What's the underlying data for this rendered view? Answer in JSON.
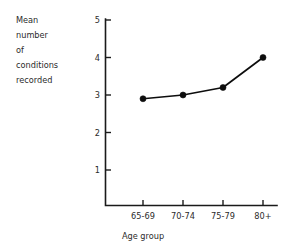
{
  "chart_data": {
    "type": "line",
    "title": "",
    "subtitle": "",
    "xlabel": "Age group",
    "ylabel": "Mean number of conditions recorded",
    "ylabel_lines": [
      "Mean",
      "number",
      "of",
      "conditions",
      "recorded"
    ],
    "categories": [
      "65-69",
      "70-74",
      "75-79",
      "80+"
    ],
    "values": [
      2.9,
      3.0,
      3.2,
      4.0
    ],
    "series": [
      {
        "name": "Mean number of conditions recorded",
        "values": [
          2.9,
          3.0,
          3.2,
          4.0
        ]
      }
    ],
    "ylim": [
      0,
      5
    ],
    "yticks": [
      1,
      2,
      3,
      4,
      5
    ],
    "ytick_labels": [
      "1",
      "2",
      "3",
      "4",
      "5"
    ],
    "xtick_labels": [
      "65-69",
      "70-74",
      "75-79",
      "80+"
    ],
    "grid": false,
    "legend": false,
    "legend_position": "none",
    "marker": "filled-circle",
    "line_color": "#0d0d0d",
    "marker_color": "#0d0d0d",
    "axis_color": "#1a1a1a",
    "background_color": "#ffffff"
  },
  "axis_labels": {
    "y_line_1": "Mean",
    "y_line_2": "number",
    "y_line_3": "of",
    "y_line_4": "conditions",
    "y_line_5": "recorded",
    "x_title": "Age group"
  },
  "y_ticks": {
    "t1": "1",
    "t2": "2",
    "t3": "3",
    "t4": "4",
    "t5": "5"
  },
  "x_ticks": {
    "c1": "65-69",
    "c2": "70-74",
    "c3": "75-79",
    "c4": "80+"
  }
}
